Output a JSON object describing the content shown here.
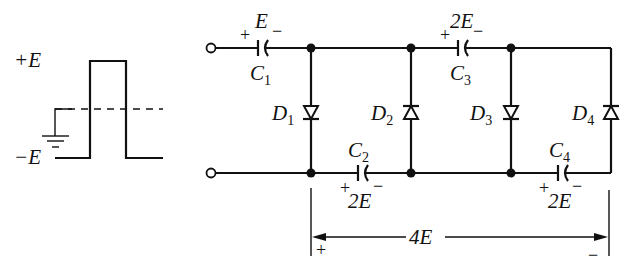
{
  "waveform": {
    "plus_label": "+E",
    "minus_label": "−E",
    "ground": "ground-symbol"
  },
  "capacitors": [
    {
      "name": "C",
      "sub": "1",
      "voltage": "E",
      "plus": "+",
      "minus": "−"
    },
    {
      "name": "C",
      "sub": "2",
      "voltage": "2E",
      "plus": "+",
      "minus": "−"
    },
    {
      "name": "C",
      "sub": "3",
      "voltage": "2E",
      "plus": "+",
      "minus": "−"
    },
    {
      "name": "C",
      "sub": "4",
      "voltage": "2E",
      "plus": "+",
      "minus": "−"
    }
  ],
  "diodes": [
    {
      "name": "D",
      "sub": "1"
    },
    {
      "name": "D",
      "sub": "2"
    },
    {
      "name": "D",
      "sub": "3"
    },
    {
      "name": "D",
      "sub": "4"
    }
  ],
  "output": {
    "label": "4E",
    "plus": "+",
    "minus": "−"
  }
}
